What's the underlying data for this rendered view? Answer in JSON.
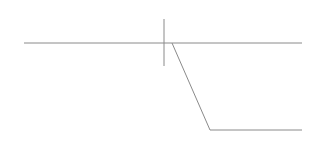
{
  "diagram": {
    "stroke_color": "#8a8a8a",
    "stroke_width": 1,
    "upper_line": {
      "x1": 24,
      "y1": 43,
      "x2": 302,
      "y2": 43
    },
    "vertical_marker": {
      "x1": 164,
      "y1": 19,
      "x2": 164,
      "y2": 66
    },
    "step_path": {
      "points": "172,43 210,130 302,130"
    }
  }
}
